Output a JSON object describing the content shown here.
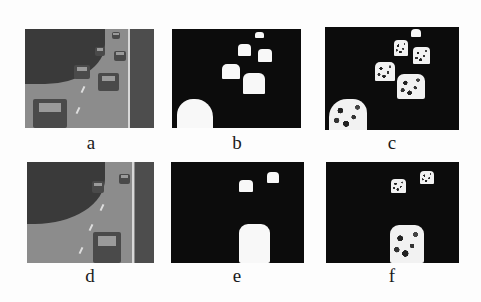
{
  "figure": {
    "panels": [
      {
        "id": "a",
        "label": "a",
        "kind": "photo",
        "description": "grayscale highway traffic frame (original)"
      },
      {
        "id": "b",
        "label": "b",
        "kind": "mask",
        "description": "binary foreground mask of frame a"
      },
      {
        "id": "c",
        "label": "c",
        "kind": "mask",
        "description": "speckled foreground detection result of frame a"
      },
      {
        "id": "d",
        "label": "d",
        "kind": "photo",
        "description": "grayscale highway traffic frame (original)"
      },
      {
        "id": "e",
        "label": "e",
        "kind": "mask",
        "description": "binary foreground mask of frame d"
      },
      {
        "id": "f",
        "label": "f",
        "kind": "mask",
        "description": "speckled foreground detection result of frame d"
      }
    ]
  }
}
